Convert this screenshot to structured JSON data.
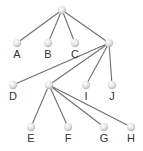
{
  "diagram": {
    "type": "tree",
    "colors": {
      "edge": "#6f6f6f",
      "node_highlight": "#ffffff",
      "node_shade": "#c9c9c9",
      "label": "#333333"
    },
    "nodes": [
      {
        "id": "root",
        "label": "",
        "x": 62,
        "y": 10
      },
      {
        "id": "A",
        "label": "A",
        "x": 17,
        "y": 43
      },
      {
        "id": "B",
        "label": "B",
        "x": 48,
        "y": 43
      },
      {
        "id": "C",
        "label": "C",
        "x": 75,
        "y": 43
      },
      {
        "id": "n1",
        "label": "",
        "x": 109,
        "y": 43
      },
      {
        "id": "D",
        "label": "D",
        "x": 13,
        "y": 85
      },
      {
        "id": "n2",
        "label": "",
        "x": 49,
        "y": 85
      },
      {
        "id": "I",
        "label": "I",
        "x": 86,
        "y": 85
      },
      {
        "id": "J",
        "label": "J",
        "x": 112,
        "y": 85
      },
      {
        "id": "E",
        "label": "E",
        "x": 31,
        "y": 127
      },
      {
        "id": "F",
        "label": "F",
        "x": 68,
        "y": 127
      },
      {
        "id": "G",
        "label": "G",
        "x": 104,
        "y": 127
      },
      {
        "id": "H",
        "label": "H",
        "x": 131,
        "y": 127
      }
    ],
    "edges": [
      [
        "root",
        "A"
      ],
      [
        "root",
        "B"
      ],
      [
        "root",
        "C"
      ],
      [
        "root",
        "n1"
      ],
      [
        "n1",
        "D"
      ],
      [
        "n1",
        "n2"
      ],
      [
        "n1",
        "I"
      ],
      [
        "n1",
        "J"
      ],
      [
        "n2",
        "E"
      ],
      [
        "n2",
        "F"
      ],
      [
        "n2",
        "G"
      ],
      [
        "n2",
        "H"
      ]
    ]
  }
}
